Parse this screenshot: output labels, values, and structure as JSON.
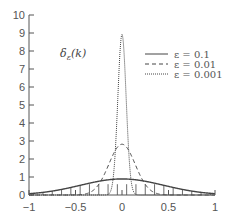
{
  "chart_data": {
    "type": "line",
    "title": "",
    "annotation": "δ_ε(k)",
    "xlabel": "",
    "ylabel": "",
    "xlim": [
      -1,
      1
    ],
    "ylim": [
      0,
      10
    ],
    "xticks": [
      -1,
      -0.5,
      0,
      0.5,
      1
    ],
    "xtick_labels": [
      "−1",
      "−0.5",
      "0",
      "0.5",
      "1"
    ],
    "yticks": [
      0,
      1,
      2,
      3,
      4,
      5,
      6,
      7,
      8,
      9,
      10
    ],
    "ytick_labels": [
      "0",
      "1",
      "2",
      "3",
      "4",
      "5",
      "6",
      "7",
      "8",
      "9",
      "10"
    ],
    "grid": false,
    "legend_position": "upper right",
    "formula": "δ_ε(k) = exp(−k²/(4ε)) / (2√(πε))",
    "series": [
      {
        "name": "ε = 0.1",
        "epsilon": 0.1,
        "style": "solid",
        "peak": 0.89,
        "x": [
          -1,
          -0.75,
          -0.5,
          -0.25,
          0,
          0.25,
          0.5,
          0.75,
          1
        ],
        "values": [
          0.07,
          0.22,
          0.48,
          0.76,
          0.89,
          0.76,
          0.48,
          0.22,
          0.07
        ]
      },
      {
        "name": "ε = 0.01",
        "epsilon": 0.01,
        "style": "dashed",
        "peak": 2.82,
        "x": [
          -0.4,
          -0.3,
          -0.2,
          -0.1,
          0,
          0.1,
          0.2,
          0.3,
          0.4
        ],
        "values": [
          0.05,
          0.3,
          1.04,
          2.2,
          2.82,
          2.2,
          1.04,
          0.3,
          0.05
        ],
        "note": "≈0 outside ±0.4"
      },
      {
        "name": "ε = 0.001",
        "epsilon": 0.001,
        "style": "dotted",
        "peak": 8.92,
        "x": [
          -0.15,
          -0.1,
          -0.05,
          0,
          0.05,
          0.1,
          0.15
        ],
        "values": [
          0.03,
          0.73,
          4.63,
          8.92,
          4.63,
          0.73,
          0.03
        ],
        "note": "≈0 outside ±0.15"
      }
    ]
  },
  "legend": {
    "items": [
      {
        "label": "ε = 0.1",
        "style": "solid"
      },
      {
        "label": "ε = 0.01",
        "style": "dashed"
      },
      {
        "label": "ε = 0.001",
        "style": "dotted"
      }
    ]
  },
  "colors": {
    "line": "#444444",
    "axis": "#555555",
    "text": "#555555",
    "background": "#ffffff"
  }
}
